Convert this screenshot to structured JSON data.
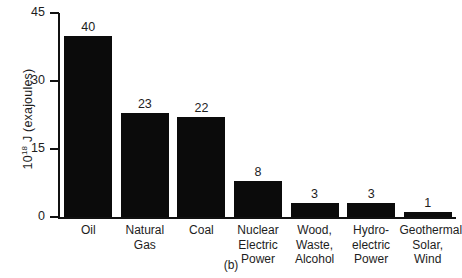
{
  "figure": {
    "panel_label": "(b)",
    "ylabel_prefix": "10",
    "ylabel_exponent": "18",
    "ylabel_suffix": " J (exajoules)"
  },
  "chart_data": {
    "type": "bar",
    "title": "",
    "subtitle": "",
    "xlabel": "",
    "ylabel": "10^18 J (exajoules)",
    "ylim": [
      0,
      45
    ],
    "yticks": [
      0,
      15,
      30,
      45
    ],
    "ytick_labels": [
      "0",
      "15",
      "30",
      "45"
    ],
    "grid": false,
    "legend": null,
    "bar_color": "#0b0b0b",
    "value_labels_shown": true,
    "categories": [
      "Oil",
      "Natural Gas",
      "Coal",
      "Nuclear Electric Power",
      "Wood, Waste, Alcohol",
      "Hydro-electric Power",
      "Geothermal, Solar, Wind"
    ],
    "category_lines": [
      [
        "Oil"
      ],
      [
        "Natural",
        "Gas"
      ],
      [
        "Coal"
      ],
      [
        "Nuclear",
        "Electric",
        "Power"
      ],
      [
        "Wood,",
        "Waste,",
        "Alcohol"
      ],
      [
        "Hydro-",
        "electric",
        "Power"
      ],
      [
        "Geothermal,",
        "Solar,",
        "Wind"
      ]
    ],
    "values": [
      40,
      23,
      22,
      8,
      3,
      3,
      1
    ],
    "value_labels": [
      "40",
      "23",
      "22",
      "8",
      "3",
      "3",
      "1"
    ]
  }
}
